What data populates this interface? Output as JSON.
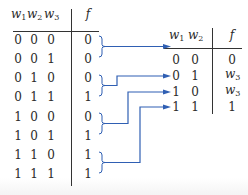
{
  "left_table": {
    "headers": [
      {
        "var": "w",
        "sub": "1"
      },
      {
        "var": "w",
        "sub": "2"
      },
      {
        "var": "w",
        "sub": "3"
      },
      {
        "var": "f",
        "sub": ""
      }
    ],
    "rows": [
      [
        "0",
        "0",
        "0",
        "0"
      ],
      [
        "0",
        "0",
        "1",
        "0"
      ],
      [
        "0",
        "1",
        "0",
        "0"
      ],
      [
        "0",
        "1",
        "1",
        "1"
      ],
      [
        "1",
        "0",
        "0",
        "0"
      ],
      [
        "1",
        "0",
        "1",
        "1"
      ],
      [
        "1",
        "1",
        "0",
        "1"
      ],
      [
        "1",
        "1",
        "1",
        "1"
      ]
    ]
  },
  "right_table": {
    "headers": [
      {
        "var": "w",
        "sub": "1"
      },
      {
        "var": "w",
        "sub": "2"
      },
      {
        "var": "f",
        "sub": ""
      }
    ],
    "rows": [
      [
        "0",
        "0",
        "0"
      ],
      [
        "0",
        "1",
        "w3"
      ],
      [
        "1",
        "0",
        "w3"
      ],
      [
        "1",
        "1",
        "1"
      ]
    ],
    "f_display": [
      {
        "var": "0",
        "sub": ""
      },
      {
        "var": "w",
        "sub": "3"
      },
      {
        "var": "w",
        "sub": "3"
      },
      {
        "var": "1",
        "sub": ""
      }
    ]
  },
  "connector_color": "#2f5fb3",
  "line_color": "#333333"
}
